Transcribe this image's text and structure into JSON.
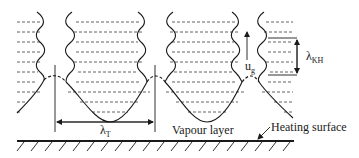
{
  "diagram": {
    "type": "film-boiling-schematic",
    "colors": {
      "line": "#1a1a1a",
      "dash": "#3a3a3a",
      "background": "#ffffff"
    },
    "labels": {
      "taylor_wavelength": {
        "main": "λ",
        "sub": "T"
      },
      "kh_wavelength": {
        "main": "λ",
        "sub": "KH"
      },
      "vapour_velocity": {
        "main": "u",
        "sub": "g"
      },
      "vapour_layer": "Vapour layer",
      "heating_surface": "Heating surface"
    },
    "elements": [
      "vapour-columns",
      "liquid-dashed-lines",
      "liquid-vapour-interface",
      "heating-surface-hatched",
      "taylor-wavelength-dimension",
      "kh-wavelength-bracket",
      "vapour-velocity-arrow"
    ]
  }
}
